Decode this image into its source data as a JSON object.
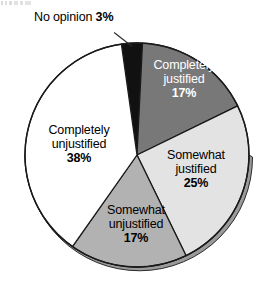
{
  "chart_data": {
    "type": "pie",
    "title": "",
    "subtitle": "",
    "xlabel": "",
    "ylabel": "",
    "legend_position": "none",
    "grid": false,
    "labels_inside": true,
    "units": "%",
    "categories": [
      "No opinion",
      "Completely justified",
      "Somewhat justified",
      "Somewhat unjustified",
      "Completely unjustified"
    ],
    "values": [
      3,
      17,
      25,
      17,
      38
    ],
    "slices": [
      {
        "name": "no-opinion",
        "label": "No opinion",
        "value": 3,
        "value_text": "3%",
        "color": "#111111",
        "text_color": "#000000",
        "start_angle": -8,
        "end_angle": 2.8,
        "callout": true
      },
      {
        "name": "completely-justified",
        "label_line1": "Completely",
        "label_line2": "justified",
        "value": 17,
        "value_text": "17%",
        "color": "#787878",
        "text_color": "#ffffff",
        "start_angle": 2.8,
        "end_angle": 64
      },
      {
        "name": "somewhat-justified",
        "label_line1": "Somewhat",
        "label_line2": "justified",
        "value": 25,
        "value_text": "25%",
        "color": "#e3e3e3",
        "text_color": "#000000",
        "start_angle": 64,
        "end_angle": 154
      },
      {
        "name": "somewhat-unjustified",
        "label_line1": "Somewhat",
        "label_line2": "unjustified",
        "value": 17,
        "value_text": "17%",
        "color": "#b2b2b2",
        "text_color": "#000000",
        "start_angle": 154,
        "end_angle": 215.2
      },
      {
        "name": "completely-unjustified",
        "label_line1": "Completely",
        "label_line2": "unjustified",
        "value": 38,
        "value_text": "38%",
        "color": "#ffffff",
        "text_color": "#000000",
        "start_angle": 215.2,
        "end_angle": 352
      }
    ],
    "colors": {
      "no_opinion": "#111111",
      "completely_justified": "#787878",
      "somewhat_justified": "#e3e3e3",
      "somewhat_unjustified": "#b2b2b2",
      "completely_unjustified": "#ffffff",
      "outline": "#1a1a1a",
      "shadow_rim": "#9a9a9a",
      "background": "#ffffff"
    }
  },
  "labels": {
    "no_opinion": {
      "name": "No opinion",
      "percent": "3%"
    },
    "completely_justified": {
      "line1": "Completely",
      "line2": "justified",
      "percent": "17%"
    },
    "somewhat_justified": {
      "line1": "Somewhat",
      "line2": "justified",
      "percent": "25%"
    },
    "somewhat_unjustified": {
      "line1": "Somewhat",
      "line2": "unjustified",
      "percent": "17%"
    },
    "completely_unjustified": {
      "line1": "Completely",
      "line2": "unjustified",
      "percent": "38%"
    }
  }
}
